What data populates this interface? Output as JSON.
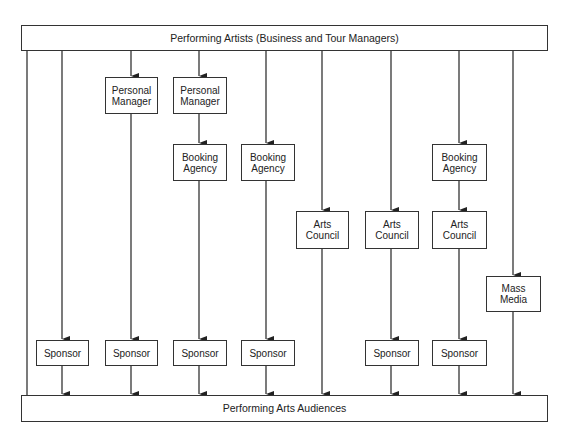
{
  "diagram": {
    "top": {
      "label": "Performing Artists (Business and Tour Managers)"
    },
    "bottom": {
      "label": "Performing Arts Audiences"
    },
    "nodes": {
      "pm1": "Personal\nManager",
      "pm2": "Personal\nManager",
      "ba3": "Booking\nAgency",
      "ba4": "Booking\nAgency",
      "ba7": "Booking\nAgency",
      "ac5": "Arts\nCouncil",
      "ac6": "Arts\nCouncil",
      "ac7": "Arts\nCouncil",
      "mm8": "Mass\nMedia",
      "sp1": "Sponsor",
      "sp2": "Sponsor",
      "sp3": "Sponsor",
      "sp4": "Sponsor",
      "sp6": "Sponsor",
      "sp7": "Sponsor"
    },
    "channels": [
      {
        "id": 0,
        "path": [
          "Performing Artists",
          "Performing Arts Audiences"
        ]
      },
      {
        "id": 1,
        "path": [
          "Performing Artists",
          "Sponsor",
          "Performing Arts Audiences"
        ]
      },
      {
        "id": 2,
        "path": [
          "Performing Artists",
          "Personal Manager",
          "Sponsor",
          "Performing Arts Audiences"
        ]
      },
      {
        "id": 3,
        "path": [
          "Performing Artists",
          "Personal Manager",
          "Booking Agency",
          "Sponsor",
          "Performing Arts Audiences"
        ]
      },
      {
        "id": 4,
        "path": [
          "Performing Artists",
          "Booking Agency",
          "Sponsor",
          "Performing Arts Audiences"
        ]
      },
      {
        "id": 5,
        "path": [
          "Performing Artists",
          "Arts Council",
          "Performing Arts Audiences"
        ]
      },
      {
        "id": 6,
        "path": [
          "Performing Artists",
          "Arts Council",
          "Sponsor",
          "Performing Arts Audiences"
        ]
      },
      {
        "id": 7,
        "path": [
          "Performing Artists",
          "Booking Agency",
          "Arts Council",
          "Sponsor",
          "Performing Arts Audiences"
        ]
      },
      {
        "id": 8,
        "path": [
          "Performing Artists",
          "Mass Media",
          "Performing Arts Audiences"
        ]
      }
    ]
  }
}
